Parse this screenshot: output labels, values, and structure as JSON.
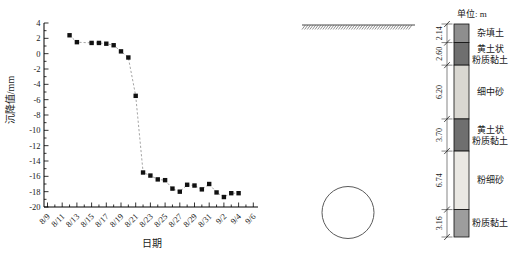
{
  "chart_data": {
    "type": "scatter",
    "title": "",
    "xlabel": "日期",
    "ylabel": "沉降值/mm",
    "ylim": [
      -20,
      4
    ],
    "y_tick_step": 2,
    "y_ticks": [
      4,
      2,
      0,
      -2,
      -4,
      -6,
      -8,
      -10,
      -12,
      -14,
      -16,
      -18,
      -20
    ],
    "x_tick_labels": [
      "8/9",
      "8/11",
      "8/13",
      "8/15",
      "8/17",
      "8/19",
      "8/21",
      "8/23",
      "8/25",
      "8/27",
      "8/29",
      "8/31",
      "9/2",
      "9/4",
      "9/6"
    ],
    "marker": "square",
    "marker_color": "#111111",
    "line_style": "dashed",
    "line_color": "#9a9a9a",
    "grid": false,
    "legend": "none",
    "points": [
      {
        "date": "8/12",
        "value": 2.4
      },
      {
        "date": "8/13",
        "value": 1.5
      },
      {
        "date": "8/15",
        "value": 1.4
      },
      {
        "date": "8/16",
        "value": 1.4
      },
      {
        "date": "8/17",
        "value": 1.3
      },
      {
        "date": "8/18",
        "value": 1.1
      },
      {
        "date": "8/19",
        "value": 0.3
      },
      {
        "date": "8/20",
        "value": -0.5
      },
      {
        "date": "8/21",
        "value": -5.5
      },
      {
        "date": "8/22",
        "value": -15.5
      },
      {
        "date": "8/23",
        "value": -15.9
      },
      {
        "date": "8/24",
        "value": -16.4
      },
      {
        "date": "8/25",
        "value": -16.5
      },
      {
        "date": "8/26",
        "value": -17.6
      },
      {
        "date": "8/27",
        "value": -18.0
      },
      {
        "date": "8/28",
        "value": -17.1
      },
      {
        "date": "8/29",
        "value": -17.2
      },
      {
        "date": "8/30",
        "value": -17.7
      },
      {
        "date": "8/31",
        "value": -17.0
      },
      {
        "date": "9/1",
        "value": -18.1
      },
      {
        "date": "9/2",
        "value": -18.7
      },
      {
        "date": "9/3",
        "value": -18.2
      },
      {
        "date": "9/4",
        "value": -18.2
      }
    ]
  },
  "profile": {
    "unit_label": "单位: m",
    "ground_surface": "hatched-line",
    "tunnel_shape": "circle",
    "total_depth_m": 24.54,
    "layers": [
      {
        "thickness_m": 2.14,
        "thickness_label": "2.14",
        "label_lines": [
          "杂填土"
        ],
        "color": "#8e8e8e"
      },
      {
        "thickness_m": 2.6,
        "thickness_label": "2.60",
        "label_lines": [
          "黄土状",
          "粉质黏土"
        ],
        "color": "#6f6f6f"
      },
      {
        "thickness_m": 6.2,
        "thickness_label": "6.20",
        "label_lines": [
          "细中砂"
        ],
        "color": "#d9d7d1"
      },
      {
        "thickness_m": 3.7,
        "thickness_label": "3.70",
        "label_lines": [
          "黄土状",
          "粉质黏土"
        ],
        "color": "#6f6f6f"
      },
      {
        "thickness_m": 6.74,
        "thickness_label": "6.74",
        "label_lines": [
          "粉细砂"
        ],
        "color": "#eae8e3"
      },
      {
        "thickness_m": 3.16,
        "thickness_label": "3.16",
        "label_lines": [
          "粉质黏土"
        ],
        "color": "#9d9d9d"
      }
    ]
  }
}
